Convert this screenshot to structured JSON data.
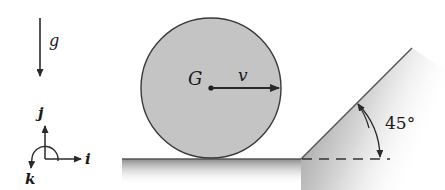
{
  "diagram": {
    "type": "mechanics-free-body",
    "gravity": {
      "label": "g",
      "direction": "down"
    },
    "axes": {
      "i": {
        "label": "i",
        "direction": "right"
      },
      "j": {
        "label": "j",
        "direction": "up"
      },
      "k": {
        "label": "k",
        "direction": "out-of-page (counterclockwise)"
      }
    },
    "disk": {
      "center_label": "G",
      "velocity_label": "v",
      "velocity_direction": "right",
      "fill_color": "#c4c4c4",
      "stroke_color": "#3a3a3a"
    },
    "ground": {
      "color": "#555555"
    },
    "incline": {
      "angle_label": "45°",
      "angle_deg": 45
    }
  }
}
